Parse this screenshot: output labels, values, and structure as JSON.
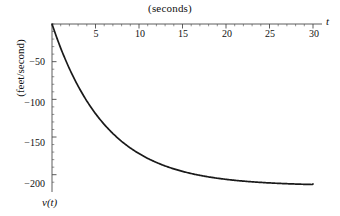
{
  "chart_data": {
    "type": "line",
    "title": "(seconds)",
    "xlabel": "t",
    "ylabel": "(feet/second)",
    "y_axis_name": "v(t)",
    "xlim": [
      0,
      30
    ],
    "ylim": [
      -215,
      0
    ],
    "grid": false,
    "legend": null,
    "xticks": [
      5,
      10,
      15,
      20,
      25,
      30
    ],
    "xtick_labels": [
      "5",
      "10",
      "15",
      "20",
      "25",
      "30"
    ],
    "yticks": [
      -50,
      -100,
      -150,
      -200
    ],
    "ytick_labels": [
      "−50",
      "−100",
      "−150",
      "−200"
    ],
    "x_minor_tick_step": 1,
    "y_minor_tick_step": 10,
    "series": [
      {
        "name": "v(t)",
        "color": "#1a1a1a",
        "x": [
          0,
          1,
          2,
          3,
          4,
          5,
          6,
          7,
          8,
          9,
          10,
          11,
          12,
          13,
          14,
          15,
          16,
          17,
          18,
          19,
          20,
          21,
          22,
          23,
          24,
          25,
          26,
          27,
          28,
          29,
          30
        ],
        "y": [
          0,
          -32.1,
          -59.3,
          -82.4,
          -102.1,
          -118.8,
          -133.0,
          -145.1,
          -155.4,
          -164.1,
          -171.5,
          -177.8,
          -183.2,
          -187.7,
          -191.6,
          -194.9,
          -197.7,
          -200.1,
          -202.1,
          -203.8,
          -205.3,
          -206.6,
          -207.7,
          -208.6,
          -209.4,
          -210.1,
          -210.7,
          -211.2,
          -211.6,
          -212.0,
          -212.3
        ]
      }
    ],
    "asymptote": -215,
    "colors": {
      "curve": "#1a1a1a",
      "axis": "#4a4a4a",
      "background": "#ffffff",
      "text": "#111111"
    }
  }
}
